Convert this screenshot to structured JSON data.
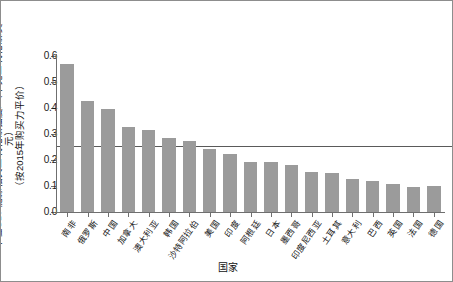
{
  "chart_data": {
    "type": "bar",
    "title": "",
    "xlabel": "国家",
    "ylabel": "单位GDP能源相关二氧化碳强度/（千克二氧化碳/美元）",
    "ylabel_line2": "（按2015年购买力平价）",
    "ylim": [
      0.0,
      0.6
    ],
    "ytick_labels": [
      "0.0",
      "0.1",
      "0.2",
      "0.3",
      "0.4",
      "0.5",
      "0.6"
    ],
    "ytick_values": [
      0.0,
      0.1,
      0.2,
      0.3,
      0.4,
      0.5,
      0.6
    ],
    "grid": false,
    "legend": "none",
    "bar_color": "#9b9b9b",
    "reference_line": {
      "value": 0.255,
      "color": "#5a5a5a",
      "label": ""
    },
    "categories": [
      "南非",
      "俄罗斯",
      "中国",
      "加拿大",
      "澳大利亚",
      "韩国",
      "沙特阿拉伯",
      "美国",
      "印度",
      "阿根廷",
      "日本",
      "墨西哥",
      "印度尼西亚",
      "土耳其",
      "意大利",
      "巴西",
      "英国",
      "法国",
      "德国"
    ],
    "values": [
      0.57,
      0.427,
      0.397,
      0.327,
      0.316,
      0.285,
      0.272,
      0.244,
      0.224,
      0.193,
      0.194,
      0.181,
      0.152,
      0.149,
      0.128,
      0.12,
      0.108,
      0.098,
      0.099
    ]
  }
}
